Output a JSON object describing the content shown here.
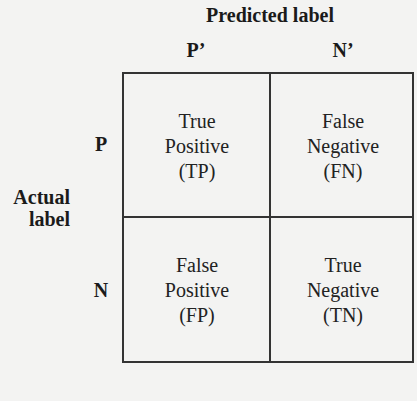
{
  "diagram": {
    "title": "Predicted label",
    "axis_label": [
      "Actual",
      "label"
    ],
    "columns": [
      {
        "label": "P’"
      },
      {
        "label": "N’"
      }
    ],
    "rows": [
      {
        "label": "P"
      },
      {
        "label": "N"
      }
    ],
    "cells": [
      {
        "lines": [
          "True",
          "Positive",
          "(TP)"
        ]
      },
      {
        "lines": [
          "False",
          "Negative",
          "(FN)"
        ]
      },
      {
        "lines": [
          "False",
          "Positive",
          "(FP)"
        ]
      },
      {
        "lines": [
          "True",
          "Negative",
          "(TN)"
        ]
      }
    ],
    "colors": {
      "background": "#f3f3f2",
      "grid_line": "#333333",
      "text": "#1a1a1a"
    }
  }
}
